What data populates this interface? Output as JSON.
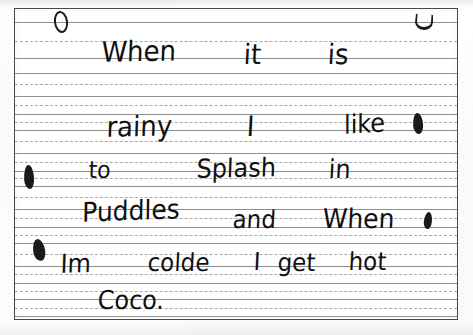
{
  "document": {
    "kind": "handwriting-worksheet-scan",
    "paper": "primary-ruled-writing-paper",
    "ink_color": "#111111",
    "rule_solid_color": "#8e8e8e",
    "rule_dashed_color": "#a9a9a9",
    "frame_color": "#4a4a4a",
    "page_color": "#ffffff"
  },
  "handwriting": {
    "full_text": "When it is rainy I like to Splash in Puddles and When Im colde I get hot Coco.",
    "lines": [
      {
        "index": 1,
        "text": "When it is",
        "words": [
          {
            "text": "When",
            "x": 101,
            "y": 66,
            "size": 26,
            "rotate": -1
          },
          {
            "text": "it",
            "x": 243,
            "y": 68,
            "size": 26,
            "rotate": 0
          },
          {
            "text": "is",
            "x": 327,
            "y": 68,
            "size": 26,
            "rotate": 0
          }
        ]
      },
      {
        "index": 2,
        "text": "rainy I like",
        "words": [
          {
            "text": "rainy",
            "x": 106,
            "y": 141,
            "size": 26,
            "rotate": -1
          },
          {
            "text": "I",
            "x": 246,
            "y": 140,
            "size": 26,
            "rotate": 0
          },
          {
            "text": "like",
            "x": 344,
            "y": 138,
            "size": 24,
            "rotate": -3
          }
        ]
      },
      {
        "index": 3,
        "text": "to Splash in",
        "words": [
          {
            "text": "to",
            "x": 88,
            "y": 182,
            "size": 22,
            "rotate": 0
          },
          {
            "text": "Splash",
            "x": 196,
            "y": 182,
            "size": 24,
            "rotate": -1
          },
          {
            "text": "in",
            "x": 328,
            "y": 182,
            "size": 24,
            "rotate": 0
          }
        ]
      },
      {
        "index": 4,
        "text": "Puddles and When",
        "words": [
          {
            "text": "Puddles",
            "x": 82,
            "y": 226,
            "size": 25,
            "rotate": -2
          },
          {
            "text": "and",
            "x": 232,
            "y": 232,
            "size": 23,
            "rotate": 0
          },
          {
            "text": "When",
            "x": 322,
            "y": 232,
            "size": 25,
            "rotate": 0
          }
        ]
      },
      {
        "index": 5,
        "text": "Im colde I get hot",
        "words": [
          {
            "text": "Im",
            "x": 60,
            "y": 277,
            "size": 24,
            "rotate": -1
          },
          {
            "text": "colde",
            "x": 147,
            "y": 275,
            "size": 23,
            "rotate": 0
          },
          {
            "text": "I",
            "x": 253,
            "y": 274,
            "size": 23,
            "rotate": 0
          },
          {
            "text": "get",
            "x": 277,
            "y": 275,
            "size": 23,
            "rotate": 0
          },
          {
            "text": "hot",
            "x": 348,
            "y": 274,
            "size": 23,
            "rotate": 0
          }
        ]
      },
      {
        "index": 6,
        "text": "Coco.",
        "words": [
          {
            "text": "Coco.",
            "x": 97,
            "y": 313,
            "size": 24,
            "rotate": 0
          }
        ]
      }
    ]
  },
  "rules": {
    "solid_y": [
      21,
      57,
      72,
      95,
      113,
      129,
      152,
      170,
      185,
      208,
      226,
      242,
      265,
      282,
      298,
      315
    ],
    "dashed_y": [
      40,
      83,
      104,
      121,
      140,
      161,
      177,
      196,
      217,
      234,
      253,
      273,
      290,
      307
    ]
  },
  "marks": [
    {
      "name": "ink-blot-top-left",
      "shape": "hollow",
      "x": 54,
      "y": 11,
      "w": 10,
      "h": 18,
      "rotate": -8
    },
    {
      "name": "ink-blot-top-right",
      "shape": "u-mark",
      "x": 415,
      "y": 14,
      "w": 14,
      "h": 13,
      "rotate": 4
    },
    {
      "name": "ink-blot-right-rainy",
      "shape": "solid",
      "x": 413,
      "y": 113,
      "w": 10,
      "h": 21,
      "rotate": -4
    },
    {
      "name": "ink-blot-left-margin",
      "shape": "solid",
      "x": 24,
      "y": 165,
      "w": 10,
      "h": 24,
      "rotate": -3
    },
    {
      "name": "ink-blot-right-when",
      "shape": "solid",
      "x": 424,
      "y": 212,
      "w": 8,
      "h": 17,
      "rotate": 6
    },
    {
      "name": "ink-blot-left-im",
      "shape": "solid",
      "x": 33,
      "y": 239,
      "w": 12,
      "h": 22,
      "rotate": -10
    }
  ]
}
